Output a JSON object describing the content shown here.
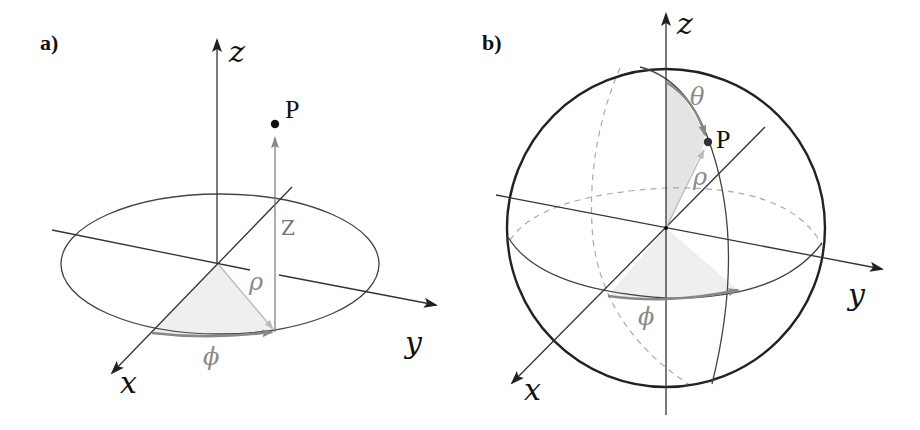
{
  "figure": {
    "panel_a": {
      "label": "a)",
      "title": "Cylindrical coordinates",
      "axes": {
        "z": "z",
        "y": "y",
        "x": "x"
      },
      "point": "P",
      "coordinates": {
        "rho": "ρ",
        "phi": "ϕ",
        "z": "Z"
      }
    },
    "panel_b": {
      "label": "b)",
      "title": "Spherical coordinates",
      "axes": {
        "z": "z",
        "y": "y",
        "x": "x"
      },
      "point": "P",
      "coordinates": {
        "theta": "θ",
        "rho": "ρ",
        "phi": "ϕ"
      }
    },
    "colors": {
      "ink": "#111111",
      "axis": "#333333",
      "shade": "#e6e6e6",
      "angle_arc": "#888888",
      "rho_line": "#bdbdbd",
      "dashed": "#aaaaaa"
    }
  }
}
